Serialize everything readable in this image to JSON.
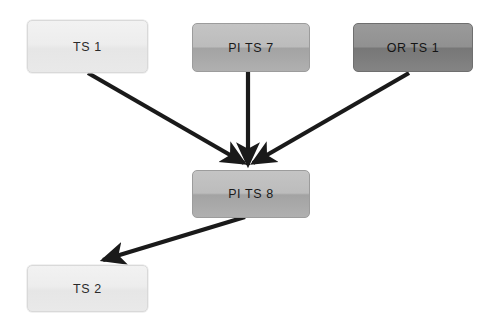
{
  "diagram": {
    "background_color": "#ffffff",
    "edge_color": "#1a1a1a",
    "nodes": [
      {
        "id": "ts1",
        "label": "TS 1",
        "tone": "light",
        "x": 27,
        "y": 20,
        "w": 121,
        "h": 53
      },
      {
        "id": "pits7",
        "label": "PI TS 7",
        "tone": "mid",
        "x": 192,
        "y": 23,
        "w": 118,
        "h": 49
      },
      {
        "id": "orts1",
        "label": "OR TS 1",
        "tone": "dark",
        "x": 353,
        "y": 23,
        "w": 120,
        "h": 49
      },
      {
        "id": "pits8",
        "label": "PI TS 8",
        "tone": "mid",
        "x": 192,
        "y": 170,
        "w": 118,
        "h": 48
      },
      {
        "id": "ts2",
        "label": "TS 2",
        "tone": "light",
        "x": 27,
        "y": 265,
        "w": 121,
        "h": 47
      }
    ],
    "edges": [
      {
        "id": "e1",
        "from": "ts1",
        "to": "pits8",
        "x1": 88,
        "y1": 73,
        "x2": 244,
        "y2": 163
      },
      {
        "id": "e2",
        "from": "pits7",
        "to": "pits8",
        "x1": 248,
        "y1": 72,
        "x2": 248,
        "y2": 165
      },
      {
        "id": "e3",
        "from": "orts1",
        "to": "pits8",
        "x1": 409,
        "y1": 73,
        "x2": 253,
        "y2": 163
      },
      {
        "id": "e4",
        "from": "pits8",
        "to": "ts2",
        "x1": 245,
        "y1": 217,
        "x2": 100,
        "y2": 261
      }
    ]
  }
}
